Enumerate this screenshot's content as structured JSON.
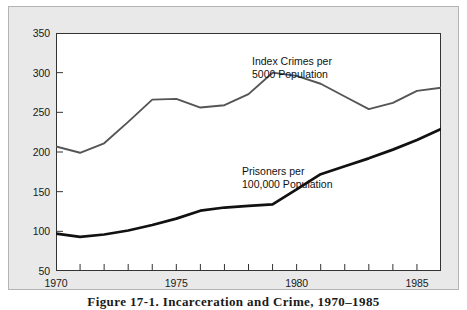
{
  "figure": {
    "caption": "Figure 17-1. Incarceration and Crime, 1970–1985"
  },
  "colors": {
    "panel_background": "#e9e9e9",
    "panel_border": "#b4b4b4",
    "plot_background": "#ffffff",
    "axis": "#333333",
    "crime_line": "#555555",
    "prisoner_line": "#111111",
    "text": "#1a1a1a"
  },
  "annotations": {
    "crime": {
      "line1": "Index Crimes per",
      "line2": "5000 Population"
    },
    "prisoners": {
      "line1": "Prisoners per",
      "line2": "100,000 Population"
    }
  },
  "axes": {
    "y_ticks": [
      "350",
      "300",
      "250",
      "200",
      "150",
      "100",
      "50"
    ],
    "x_ticks": [
      "1970",
      "1975",
      "1980",
      "1985"
    ]
  },
  "chart_data": {
    "type": "line",
    "title": "Figure 17-1. Incarceration and Crime, 1970–1985",
    "xlabel": "",
    "ylabel": "",
    "xlim": [
      1970,
      1986
    ],
    "ylim": [
      50,
      350
    ],
    "grid": false,
    "legend": "inline-annotations",
    "x": [
      1970,
      1971,
      1972,
      1973,
      1974,
      1975,
      1976,
      1977,
      1978,
      1979,
      1980,
      1981,
      1982,
      1983,
      1984,
      1985,
      1986
    ],
    "series": [
      {
        "name": "Index Crimes per 5000 Population",
        "label_line1": "Index Crimes per",
        "label_line2": "5000 Population",
        "color": "#555555",
        "values": [
          207,
          199,
          211,
          238,
          266,
          267,
          256,
          259,
          273,
          300,
          296,
          286,
          270,
          254,
          262,
          277,
          281
        ]
      },
      {
        "name": "Prisoners per 100,000 Population",
        "label_line1": "Prisoners per",
        "label_line2": "100,000 Population",
        "color": "#111111",
        "values": [
          97,
          93,
          96,
          101,
          108,
          116,
          126,
          130,
          132,
          134,
          153,
          172,
          182,
          192,
          203,
          215,
          229
        ]
      }
    ]
  }
}
